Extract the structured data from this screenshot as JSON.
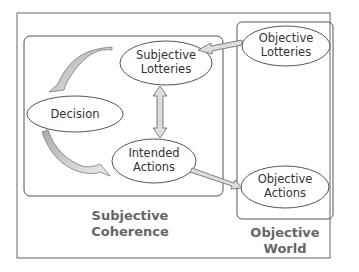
{
  "diagram": {
    "nodes": {
      "subjective_lotteries": {
        "line1": "Subjective",
        "line2": "Lotteries"
      },
      "objective_lotteries": {
        "line1": "Objective",
        "line2": "Lotteries"
      },
      "decision": {
        "label": "Decision"
      },
      "intended_actions": {
        "line1": "Intended",
        "line2": "Actions"
      },
      "objective_actions": {
        "line1": "Objective",
        "line2": "Actions"
      }
    },
    "groups": {
      "subjective": {
        "line1": "Subjective",
        "line2": "Coherence"
      },
      "objective": {
        "line1": "Objective",
        "line2": "World"
      }
    },
    "edges": [
      {
        "from": "Objective Lotteries",
        "to": "Subjective Lotteries"
      },
      {
        "from": "Subjective Lotteries",
        "to": "Intended Actions",
        "bidirectional": true
      },
      {
        "from": "Subjective Lotteries",
        "to": "Decision"
      },
      {
        "from": "Decision",
        "to": "Intended Actions"
      },
      {
        "from": "Intended Actions",
        "to": "Objective Actions"
      }
    ],
    "colors": {
      "stroke": "#555555",
      "arrow_fill": "#cccccc",
      "text": "#333333",
      "group_text": "#666666"
    }
  }
}
